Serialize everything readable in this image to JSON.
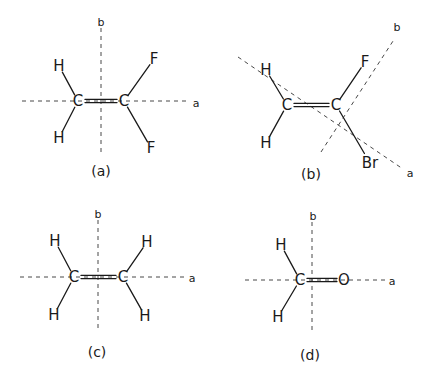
{
  "figure": {
    "width": 431,
    "height": 377,
    "ink_color": "#1a1a1a",
    "panels": [
      {
        "id": "a",
        "label": "(a)",
        "label_pos": [
          101,
          171
        ],
        "molecule": "H2C=CF2",
        "axes": [
          {
            "name": "a",
            "from": [
              22,
              101
            ],
            "to": [
              188,
              101
            ],
            "label_pos": [
              196,
              103
            ]
          },
          {
            "name": "b",
            "from": [
              101,
              28
            ],
            "to": [
              101,
              152
            ],
            "label_pos": [
              101,
              22
            ]
          }
        ],
        "atoms": [
          {
            "symbol": "C",
            "pos": [
              78,
              101
            ]
          },
          {
            "symbol": "C",
            "pos": [
              124,
              101
            ]
          },
          {
            "symbol": "H",
            "pos": [
              59,
              66
            ]
          },
          {
            "symbol": "H",
            "pos": [
              59,
              138
            ]
          },
          {
            "symbol": "F",
            "pos": [
              154,
              59
            ]
          },
          {
            "symbol": "F",
            "pos": [
              151,
              148
            ]
          }
        ],
        "bonds": [
          {
            "from": 0,
            "to": 1,
            "order": 2
          },
          {
            "from": 0,
            "to": 2,
            "order": 1
          },
          {
            "from": 0,
            "to": 3,
            "order": 1
          },
          {
            "from": 1,
            "to": 4,
            "order": 1
          },
          {
            "from": 1,
            "to": 5,
            "order": 1
          }
        ]
      },
      {
        "id": "b",
        "label": "(b)",
        "label_pos": [
          311,
          174
        ],
        "molecule": "H2C=CFBr",
        "axes": [
          {
            "name": "a",
            "from": [
              238,
              57
            ],
            "to": [
              403,
              169
            ],
            "label_pos": [
              410,
              173
            ]
          },
          {
            "name": "b",
            "from": [
              321,
              152
            ],
            "to": [
              395,
              38
            ],
            "label_pos": [
              397,
              27
            ]
          }
        ],
        "atoms": [
          {
            "symbol": "C",
            "pos": [
              287,
              105
            ]
          },
          {
            "symbol": "C",
            "pos": [
              336,
              105
            ]
          },
          {
            "symbol": "H",
            "pos": [
              266,
              70
            ]
          },
          {
            "symbol": "H",
            "pos": [
              266,
              143
            ]
          },
          {
            "symbol": "F",
            "pos": [
              365,
              62
            ]
          },
          {
            "symbol": "Br",
            "pos": [
              370,
              163
            ]
          }
        ],
        "bonds": [
          {
            "from": 0,
            "to": 1,
            "order": 2
          },
          {
            "from": 0,
            "to": 2,
            "order": 1
          },
          {
            "from": 0,
            "to": 3,
            "order": 1
          },
          {
            "from": 1,
            "to": 4,
            "order": 1
          },
          {
            "from": 1,
            "to": 5,
            "order": 1
          }
        ]
      },
      {
        "id": "c",
        "label": "(c)",
        "label_pos": [
          97,
          352
        ],
        "molecule": "H2C=CH2",
        "axes": [
          {
            "name": "a",
            "from": [
              20,
              277
            ],
            "to": [
              185,
              277
            ],
            "label_pos": [
              192,
              278
            ]
          },
          {
            "name": "b",
            "from": [
              98,
              220
            ],
            "to": [
              98,
              330
            ],
            "label_pos": [
              98,
              214
            ]
          }
        ],
        "atoms": [
          {
            "symbol": "C",
            "pos": [
              74,
              277
            ]
          },
          {
            "symbol": "C",
            "pos": [
              123,
              277
            ]
          },
          {
            "symbol": "H",
            "pos": [
              55,
              241
            ]
          },
          {
            "symbol": "H",
            "pos": [
              54,
              315
            ]
          },
          {
            "symbol": "H",
            "pos": [
              147,
              242
            ]
          },
          {
            "symbol": "H",
            "pos": [
              145,
              316
            ]
          }
        ],
        "bonds": [
          {
            "from": 0,
            "to": 1,
            "order": 2
          },
          {
            "from": 0,
            "to": 2,
            "order": 1
          },
          {
            "from": 0,
            "to": 3,
            "order": 1
          },
          {
            "from": 1,
            "to": 4,
            "order": 1
          },
          {
            "from": 1,
            "to": 5,
            "order": 1
          }
        ]
      },
      {
        "id": "d",
        "label": "(d)",
        "label_pos": [
          310,
          355
        ],
        "molecule": "H2C=O",
        "axes": [
          {
            "name": "a",
            "from": [
              245,
              280
            ],
            "to": [
              386,
              280
            ],
            "label_pos": [
              392,
              281
            ]
          },
          {
            "name": "b",
            "from": [
              312,
              222
            ],
            "to": [
              312,
              334
            ],
            "label_pos": [
              313,
              216
            ]
          }
        ],
        "atoms": [
          {
            "symbol": "C",
            "pos": [
              300,
              280
            ]
          },
          {
            "symbol": "O",
            "pos": [
              344,
              280
            ]
          },
          {
            "symbol": "H",
            "pos": [
              281,
              245
            ]
          },
          {
            "symbol": "H",
            "pos": [
              278,
              317
            ]
          }
        ],
        "bonds": [
          {
            "from": 0,
            "to": 1,
            "order": 2
          },
          {
            "from": 0,
            "to": 2,
            "order": 1
          },
          {
            "from": 0,
            "to": 3,
            "order": 1
          }
        ]
      }
    ]
  }
}
